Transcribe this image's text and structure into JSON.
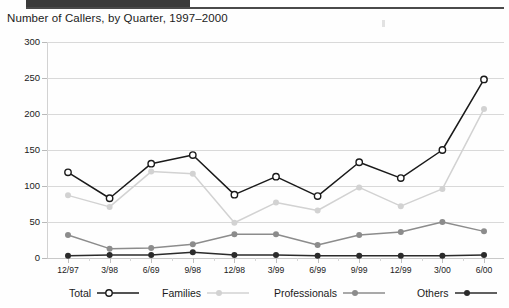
{
  "page": {
    "title": "Number of Callers, by Quarter, 1997–2000",
    "top_bar_color": "#3a3a3a"
  },
  "chart_data": {
    "type": "line",
    "title": "Number of Callers, by Quarter, 1997–2000",
    "xlabel": "",
    "ylabel": "",
    "ylim": [
      0,
      300
    ],
    "yticks": [
      0,
      50,
      100,
      150,
      200,
      250,
      300
    ],
    "grid": true,
    "legend_position": "bottom",
    "categories": [
      "12/97",
      "3/98",
      "6/69",
      "9/98",
      "12/98",
      "3/99",
      "6/99",
      "9/99",
      "12/99",
      "3/00",
      "6/00"
    ],
    "series": [
      {
        "name": "Total",
        "color": "#1a1a1a",
        "marker": "open-circle",
        "values": [
          119,
          83,
          131,
          143,
          88,
          113,
          86,
          133,
          111,
          150,
          248
        ]
      },
      {
        "name": "Families",
        "color": "#d2d2d2",
        "marker": "filled-circle",
        "values": [
          87,
          71,
          120,
          117,
          49,
          77,
          66,
          98,
          72,
          96,
          207
        ]
      },
      {
        "name": "Professionals",
        "color": "#8c8c8c",
        "marker": "filled-circle",
        "values": [
          32,
          13,
          14,
          19,
          33,
          33,
          18,
          32,
          36,
          50,
          37
        ]
      },
      {
        "name": "Others",
        "color": "#2b2b2b",
        "marker": "filled-circle",
        "values": [
          3,
          4,
          4,
          8,
          4,
          4,
          3,
          3,
          3,
          3,
          4
        ]
      }
    ]
  },
  "legend": {
    "items": [
      {
        "label": "Total",
        "color": "#1a1a1a",
        "marker": "open-circle",
        "x": 69
      },
      {
        "label": "Families",
        "color": "#d2d2d2",
        "marker": "filled-circle",
        "x": 162
      },
      {
        "label": "Professionals",
        "color": "#8c8c8c",
        "marker": "filled-circle",
        "x": 274
      },
      {
        "label": "Others",
        "color": "#2b2b2b",
        "marker": "filled-circle",
        "x": 417
      }
    ]
  }
}
